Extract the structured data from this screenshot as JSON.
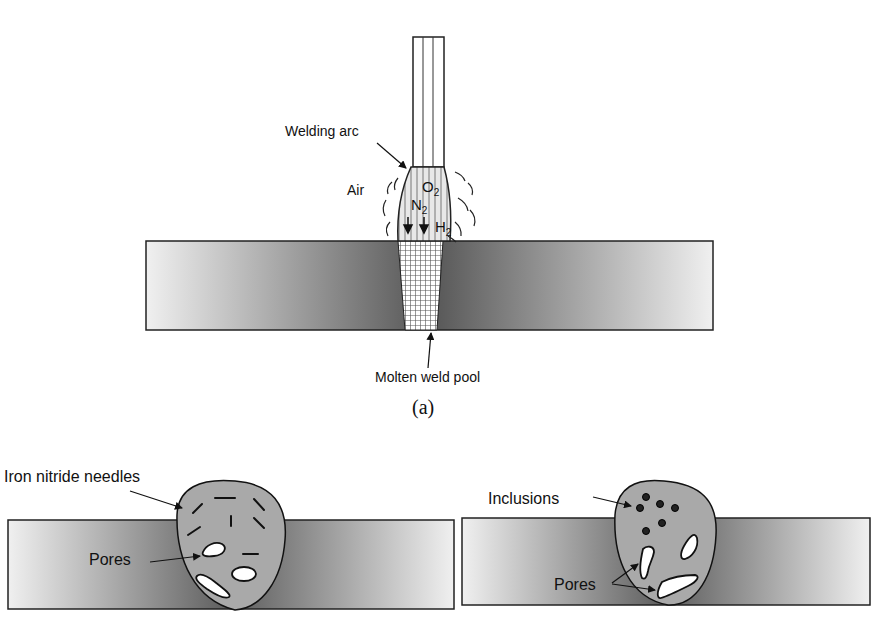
{
  "figure": {
    "panel_a": {
      "caption": "(a)",
      "labels": {
        "welding_arc": "Welding arc",
        "air": "Air",
        "o2": "O",
        "o2_sub": "2",
        "n2": "N",
        "n2_sub": "2",
        "h2": "H",
        "h2_sub": "2",
        "molten_pool": "Molten weld pool"
      }
    },
    "panel_b": {
      "labels": {
        "needles": "Iron nitride needles",
        "pores": "Pores"
      }
    },
    "panel_c": {
      "labels": {
        "inclusions": "Inclusions",
        "pores": "Pores"
      }
    },
    "colors": {
      "plate_dark": "#5a5a5a",
      "plate_light": "#f2f2f2",
      "weld": "#a9a9a9",
      "outline": "#111111"
    }
  }
}
